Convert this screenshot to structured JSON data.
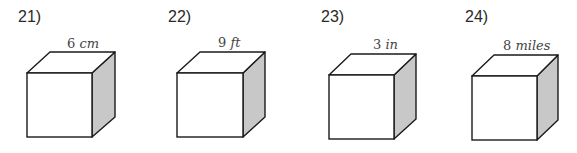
{
  "problems": [
    {
      "number": "21)",
      "value": "6",
      "unit": "cm"
    },
    {
      "number": "22)",
      "value": "9",
      "unit": "ft"
    },
    {
      "number": "23)",
      "value": "3",
      "unit": "in"
    },
    {
      "number": "24)",
      "value": "8",
      "unit": "miles"
    }
  ],
  "colors": {
    "stroke": "#1a1a1a",
    "front_face": "#ffffff",
    "top_face": "#ffffff",
    "side_face": "#c8c8c8"
  }
}
